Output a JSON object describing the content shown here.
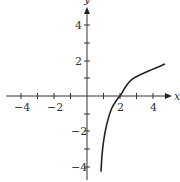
{
  "chart_data": {
    "type": "line",
    "title": "",
    "xlabel": "x",
    "ylabel": "y",
    "xlim": [
      -5,
      5
    ],
    "ylim": [
      -5,
      5
    ],
    "grid": false,
    "x_ticks": [
      -4,
      -3,
      -2,
      -1,
      1,
      2,
      3,
      4
    ],
    "x_tick_labels": [
      "-4",
      "-2",
      "2",
      "4"
    ],
    "y_ticks": [
      -4,
      -3,
      -2,
      -1,
      1,
      2,
      3,
      4
    ],
    "y_tick_labels": [
      "4",
      "2",
      "-2",
      "-4"
    ],
    "series": [
      {
        "name": "curve",
        "description": "logarithmic-shaped curve with vertical asymptote near x≈0.8, crossing x-axis at x≈2",
        "x": [
          0.85,
          0.9,
          1.0,
          1.19,
          1.5,
          1.9,
          2.0,
          2.67,
          3.8,
          4.73
        ],
        "y": [
          -4.3,
          -3.5,
          -2.6,
          -1.64,
          -0.7,
          -0.1,
          0,
          0.9,
          1.45,
          1.81
        ]
      }
    ],
    "color": "#222222"
  },
  "labels": {
    "x_axis": "x",
    "y_axis": "y",
    "x_neg4": "−4",
    "x_neg2": "−2",
    "x_2": "2",
    "x_4": "4",
    "y_4": "4",
    "y_2": "2",
    "y_neg2": "−2",
    "y_neg4": "−4"
  }
}
